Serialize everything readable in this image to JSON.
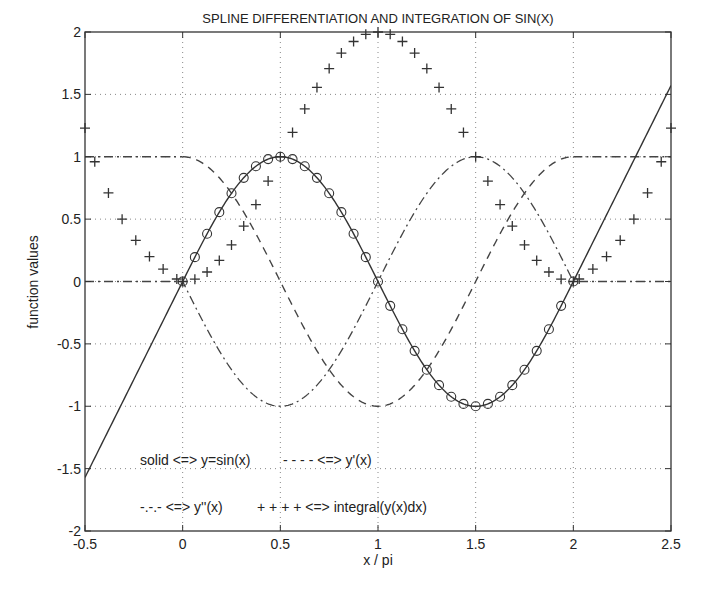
{
  "chart_data": {
    "type": "line",
    "title": "SPLINE DIFFERENTIATION AND INTEGRATION OF SIN(X)",
    "xlabel": "x / pi",
    "ylabel": "function values",
    "xlim": [
      -0.5,
      2.5
    ],
    "ylim": [
      -2,
      2
    ],
    "xticks": [
      -0.5,
      0,
      0.5,
      1,
      1.5,
      2,
      2.5
    ],
    "xtick_labels": [
      "-0.5",
      "0",
      "0.5",
      "1",
      "1.5",
      "2",
      "2.5"
    ],
    "yticks": [
      -2,
      -1.5,
      -1,
      -0.5,
      0,
      0.5,
      1,
      1.5,
      2
    ],
    "ytick_labels": [
      "-2",
      "-1.5",
      "-1",
      "-0.5",
      "0",
      "0.5",
      "1",
      "1.5",
      "2"
    ],
    "grid": true,
    "series": [
      {
        "name": "y=sin(x)",
        "style": "solid",
        "marker": "circle",
        "description": "sin(pi*x) on [0,2] with linear extrapolation (slope pi) outside",
        "x": [
          -0.5,
          0,
          0.0625,
          0.125,
          0.1875,
          0.25,
          0.3125,
          0.375,
          0.4375,
          0.5,
          0.5625,
          0.625,
          0.6875,
          0.75,
          0.8125,
          0.875,
          0.9375,
          1,
          1.0625,
          1.125,
          1.1875,
          1.25,
          1.3125,
          1.375,
          1.4375,
          1.5,
          1.5625,
          1.625,
          1.6875,
          1.75,
          1.8125,
          1.875,
          1.9375,
          2,
          2.5
        ],
        "values": [
          -1.571,
          0,
          0.195,
          0.383,
          0.556,
          0.707,
          0.831,
          0.924,
          0.981,
          1,
          0.981,
          0.924,
          0.831,
          0.707,
          0.556,
          0.383,
          0.195,
          0,
          -0.195,
          -0.383,
          -0.556,
          -0.707,
          -0.831,
          -0.924,
          -0.981,
          -1,
          -0.981,
          -0.924,
          -0.831,
          -0.707,
          -0.556,
          -0.383,
          -0.195,
          0,
          1.571
        ]
      },
      {
        "name": "y'(x)",
        "style": "dashed",
        "description": "cos(pi*x) on [0,2], constant 1 outside",
        "x": [
          -0.5,
          0,
          0.25,
          0.5,
          0.75,
          1,
          1.25,
          1.5,
          1.75,
          2,
          2.5
        ],
        "values": [
          1,
          1,
          0.707,
          0,
          -0.707,
          -1,
          -0.707,
          0,
          0.707,
          1,
          1
        ]
      },
      {
        "name": "y''(x)",
        "style": "dash-dot",
        "description": "-sin(pi*x) on [0,2], 0 outside",
        "x": [
          -0.5,
          0,
          0.25,
          0.5,
          0.75,
          1,
          1.25,
          1.5,
          1.75,
          2,
          2.5
        ],
        "values": [
          0,
          0,
          -0.707,
          -1,
          -0.707,
          0,
          0.707,
          1,
          0.707,
          0,
          0
        ]
      },
      {
        "name": "integral(y(x)dx)",
        "style": "none",
        "marker": "plus",
        "description": "1-cos(pi*x) on [0,2], quadratic extrapolation outside",
        "x": [
          -0.5,
          -0.45,
          -0.38,
          -0.31,
          -0.24,
          -0.17,
          -0.1,
          -0.03,
          0,
          0.0625,
          0.125,
          0.1875,
          0.25,
          0.3125,
          0.375,
          0.4375,
          0.5,
          0.5625,
          0.625,
          0.6875,
          0.75,
          0.8125,
          0.875,
          0.9375,
          1,
          1.0625,
          1.125,
          1.1875,
          1.25,
          1.3125,
          1.375,
          1.4375,
          1.5,
          1.5625,
          1.625,
          1.6875,
          1.75,
          1.8125,
          1.875,
          1.9375,
          2,
          2.03,
          2.1,
          2.17,
          2.24,
          2.31,
          2.38,
          2.45,
          2.5
        ],
        "values": [
          1.23,
          0.96,
          0.71,
          0.5,
          0.33,
          0.2,
          0.1,
          0.02,
          0,
          0.019,
          0.076,
          0.169,
          0.293,
          0.444,
          0.617,
          0.805,
          1,
          1.195,
          1.383,
          1.556,
          1.707,
          1.831,
          1.924,
          1.981,
          2,
          1.981,
          1.924,
          1.831,
          1.707,
          1.556,
          1.383,
          1.195,
          1,
          0.805,
          0.617,
          0.444,
          0.293,
          0.169,
          0.076,
          0.019,
          0,
          0.02,
          0.1,
          0.2,
          0.33,
          0.5,
          0.71,
          0.96,
          1.23
        ]
      }
    ],
    "legend": [
      {
        "sample": "solid",
        "text": "solid <=> y=sin(x)"
      },
      {
        "sample": "- - - -",
        "text": "- - - - <=> y'(x)"
      },
      {
        "sample": "-.-.-",
        "text": "-.-.- <=> y''(x)"
      },
      {
        "sample": "+ + + +",
        "text": "+ + + + <=> integral(y(x)dx)"
      }
    ],
    "legend_position": "lower-left inside axes"
  }
}
